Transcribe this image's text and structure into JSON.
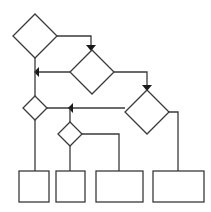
{
  "diagram": {
    "type": "flowchart",
    "title": "",
    "stroke_color": "#3a3a3a",
    "fill_color": "#ffffff",
    "arrow_color": "#1a1a1a",
    "nodes": [
      {
        "id": "d1",
        "shape": "diamond",
        "label": "",
        "cx": 35,
        "cy": 36,
        "r": 22
      },
      {
        "id": "d2",
        "shape": "diamond",
        "label": "",
        "cx": 92,
        "cy": 72,
        "r": 22
      },
      {
        "id": "d3",
        "shape": "diamond",
        "label": "",
        "cx": 147,
        "cy": 112,
        "r": 22
      },
      {
        "id": "d4",
        "shape": "diamond",
        "label": "",
        "cx": 35,
        "cy": 108,
        "r": 12
      },
      {
        "id": "d5",
        "shape": "diamond",
        "label": "",
        "cx": 70,
        "cy": 134,
        "r": 12
      },
      {
        "id": "b1",
        "shape": "rect",
        "label": "",
        "x": 19,
        "y": 171,
        "w": 30,
        "h": 31
      },
      {
        "id": "b2",
        "shape": "rect",
        "label": "",
        "x": 56,
        "y": 171,
        "w": 29,
        "h": 31
      },
      {
        "id": "b3",
        "shape": "rect",
        "label": "",
        "x": 96,
        "y": 171,
        "w": 47,
        "h": 31
      },
      {
        "id": "b4",
        "shape": "rect",
        "label": "",
        "x": 153,
        "y": 171,
        "w": 51,
        "h": 31
      }
    ],
    "edges": [
      {
        "from": "d1",
        "to": "d2",
        "arrow": "down"
      },
      {
        "from": "d2",
        "to": "d1-d4 line",
        "arrow": "left"
      },
      {
        "from": "d1",
        "to": "d4",
        "arrow": "none"
      },
      {
        "from": "d2",
        "to": "d3",
        "arrow": "down"
      },
      {
        "from": "d3",
        "to": "d4",
        "arrow": "left"
      },
      {
        "from": "d4-d3 line",
        "to": "d5",
        "arrow": "none"
      },
      {
        "from": "d4",
        "to": "b1",
        "arrow": "none"
      },
      {
        "from": "d5",
        "to": "b2",
        "arrow": "none"
      },
      {
        "from": "d5",
        "to": "b3",
        "arrow": "none"
      },
      {
        "from": "d3",
        "to": "b4",
        "arrow": "none"
      }
    ]
  }
}
